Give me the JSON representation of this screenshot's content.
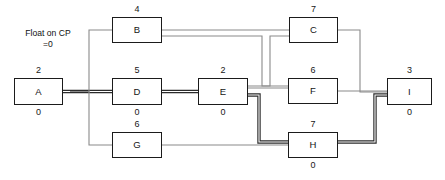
{
  "diagram": {
    "annotation": {
      "line1": "Float on CP",
      "line2": "=0"
    },
    "colors": {
      "node_border": "#1b1b1b",
      "wire": "#8a8a8a",
      "critical_wire": "#2b2b2b",
      "background": "#ffffff",
      "text": "#141414"
    },
    "nodes": [
      {
        "id": "A",
        "label": "A",
        "duration": "2",
        "float": "0",
        "x": 14,
        "y": 78,
        "w": 49,
        "h": 27
      },
      {
        "id": "B",
        "label": "B",
        "duration": "4",
        "float": "",
        "x": 112,
        "y": 17,
        "w": 50,
        "h": 26
      },
      {
        "id": "D",
        "label": "D",
        "duration": "5",
        "float": "0",
        "x": 112,
        "y": 78,
        "w": 50,
        "h": 27
      },
      {
        "id": "G",
        "label": "G",
        "duration": "6",
        "float": "",
        "x": 112,
        "y": 132,
        "w": 50,
        "h": 26
      },
      {
        "id": "E",
        "label": "E",
        "duration": "2",
        "float": "0",
        "x": 198,
        "y": 78,
        "w": 50,
        "h": 27
      },
      {
        "id": "C",
        "label": "C",
        "duration": "7",
        "float": "",
        "x": 289,
        "y": 17,
        "w": 49,
        "h": 26
      },
      {
        "id": "F",
        "label": "F",
        "duration": "6",
        "float": "",
        "x": 288,
        "y": 78,
        "w": 50,
        "h": 26
      },
      {
        "id": "H",
        "label": "H",
        "duration": "7",
        "float": "0",
        "x": 288,
        "y": 132,
        "w": 50,
        "h": 26
      },
      {
        "id": "I",
        "label": "I",
        "duration": "3",
        "float": "0",
        "x": 387,
        "y": 78,
        "w": 45,
        "h": 27
      }
    ],
    "edges": [
      {
        "from": "A",
        "to": "D",
        "critical": true,
        "path": "M63,91.5 L112,91.5"
      },
      {
        "from": "A",
        "to": "B",
        "critical": false,
        "path": "M70,91.5 L89,91.5 L89,30 L112,30"
      },
      {
        "from": "A",
        "to": "G",
        "critical": false,
        "path": "M70,91.5 L89,91.5 L89,145 L112,145"
      },
      {
        "from": "D",
        "to": "E",
        "critical": true,
        "path": "M162,91.5 L198,91.5"
      },
      {
        "from": "B",
        "to": "C",
        "critical": false,
        "path": "M162,30 L289,30"
      },
      {
        "from": "B",
        "to": "F",
        "critical": false,
        "path": "M162,36 L262,36 L262,86 L288,86"
      },
      {
        "from": "E",
        "to": "F",
        "critical": false,
        "path": "M248,88 L253,88 L253,88 L288,88"
      },
      {
        "from": "E",
        "to": "C",
        "critical": false,
        "path": "M248,86 L270,86 L270,36 L289,36"
      },
      {
        "from": "E",
        "to": "H",
        "critical": true,
        "path": "M248,95 L259,95 L259,142 L288,142"
      },
      {
        "from": "G",
        "to": "H",
        "critical": false,
        "path": "M162,145 L288,145"
      },
      {
        "from": "C",
        "to": "I",
        "critical": false,
        "path": "M338,30 L360,30 L360,92 L387,92"
      },
      {
        "from": "F",
        "to": "I",
        "critical": false,
        "path": "M338,91 L387,91"
      },
      {
        "from": "H",
        "to": "I",
        "critical": true,
        "path": "M338,142 L375,142 L375,95 L387,95"
      }
    ]
  }
}
